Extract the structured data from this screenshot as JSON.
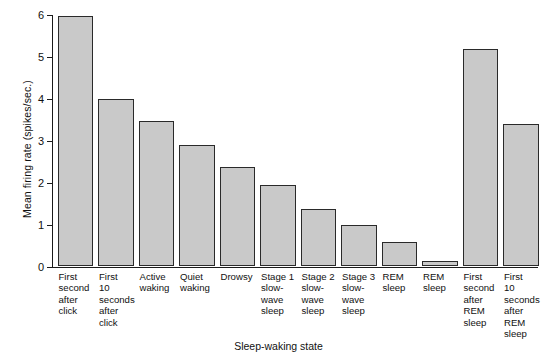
{
  "chart_data": {
    "type": "bar",
    "title": "",
    "xlabel": "Sleep-waking state",
    "ylabel": "Mean firing rate (spikes/sec.)",
    "ylim": [
      0,
      6
    ],
    "yticks": [
      0,
      1,
      2,
      3,
      4,
      5,
      6
    ],
    "ytick_labels": [
      "0",
      "1",
      "2",
      "3",
      "4",
      "5",
      "6"
    ],
    "grid": false,
    "legend": "none",
    "bar_fill_color": "#c9c9c9",
    "bar_edge_color": "#2a2a2a",
    "categories": [
      "First\nsecond\nafter\nclick",
      "First\n10\nseconds\nafter\nclick",
      "Active\nwaking",
      "Quiet\nwaking",
      "Drowsy",
      "Stage 1\nslow-\nwave\nsleep",
      "Stage 2\nslow-\nwave\nsleep",
      "Stage 3\nslow-\nwave\nsleep",
      "REM\nsleep",
      "REM\nsleep",
      "First\nsecond\nafter\nREM\nsleep",
      "First\n10\nseconds\nafter\nREM\nsleep"
    ],
    "values": [
      5.95,
      3.98,
      3.45,
      2.88,
      2.35,
      1.92,
      1.35,
      0.97,
      0.57,
      0.12,
      5.17,
      3.37
    ]
  }
}
